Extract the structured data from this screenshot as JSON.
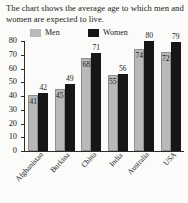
{
  "title": "The chart shows the average age to which men and women are expected to live.",
  "legend": {
    "men": {
      "label": "Men",
      "color": "#b9b9b9"
    },
    "women": {
      "label": "Women",
      "color": "#161616"
    }
  },
  "axis": {
    "ticks": [
      "80",
      "70",
      "60",
      "50",
      "40",
      "30",
      "20",
      "10",
      "0"
    ]
  },
  "chart_data": {
    "type": "bar",
    "title": "The chart shows the average age to which men and women are expected to live.",
    "xlabel": "",
    "ylabel": "",
    "ylim": [
      0,
      80
    ],
    "ytick_step": 10,
    "grid": false,
    "legend_position": "top",
    "categories": [
      "Afghanistan",
      "Burkina",
      "China",
      "India",
      "Australia",
      "USA"
    ],
    "series": [
      {
        "name": "Men",
        "color": "#b9b9b9",
        "values": [
          41,
          45,
          68,
          55,
          74,
          72
        ]
      },
      {
        "name": "Women",
        "color": "#161616",
        "values": [
          42,
          49,
          71,
          56,
          80,
          79
        ]
      }
    ]
  }
}
